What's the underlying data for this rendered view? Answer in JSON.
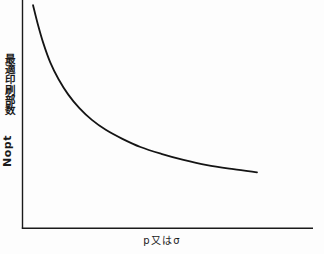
{
  "figure": {
    "background_color": "#fdfdfd",
    "ink_color": "#1a1a1a",
    "y_axis_label_jp": "最適印刷部数",
    "y_axis_label_latin": "Nopt",
    "x_axis_label": "p又はσ"
  },
  "chart_data": {
    "type": "line",
    "title": "",
    "subtitle": "",
    "xlabel": "p又はσ",
    "ylabel": "最適印刷部数 Nopt",
    "grid": false,
    "legend": null,
    "axis_style": "open L-shaped axes, no tick marks, no tick labels",
    "xlim": [
      0,
      1
    ],
    "ylim": [
      0,
      1
    ],
    "annotations": [],
    "x": [
      0.038,
      0.055,
      0.075,
      0.1,
      0.13,
      0.165,
      0.205,
      0.25,
      0.3,
      0.36,
      0.425,
      0.5,
      0.58,
      0.665,
      0.76,
      0.845
    ],
    "values": [
      0.988,
      0.905,
      0.82,
      0.735,
      0.66,
      0.592,
      0.532,
      0.48,
      0.436,
      0.396,
      0.36,
      0.33,
      0.303,
      0.28,
      0.262,
      0.248
    ],
    "series": [
      {
        "name": "Nopt",
        "values": [
          0.988,
          0.905,
          0.82,
          0.735,
          0.66,
          0.592,
          0.532,
          0.48,
          0.436,
          0.396,
          0.36,
          0.33,
          0.303,
          0.28,
          0.262,
          0.248
        ]
      }
    ]
  }
}
